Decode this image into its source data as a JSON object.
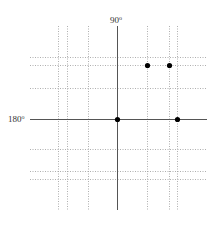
{
  "diagram": {
    "type": "coordinate-grid-with-points",
    "labels": {
      "top_axis": "90",
      "top_axis_unit": "o",
      "left_axis": "180",
      "left_axis_unit": "o"
    },
    "axes": {
      "vertical_x": 117,
      "horizontal_y": 119,
      "vertical_range": [
        26,
        210
      ],
      "horizontal_range": [
        30,
        207
      ],
      "color": "#555555"
    },
    "dotted_verticals": [
      58,
      67,
      88,
      147,
      169,
      177
    ],
    "dotted_horizontals": [
      57,
      65,
      88,
      149,
      171,
      179
    ],
    "dotted_vertical_range": [
      26,
      210
    ],
    "dotted_horizontal_range": [
      30,
      207
    ],
    "dotted_color": "#9a9a9a",
    "points": [
      {
        "x": 147,
        "y": 65
      },
      {
        "x": 169,
        "y": 65
      },
      {
        "x": 117,
        "y": 119
      },
      {
        "x": 177,
        "y": 119
      }
    ],
    "point_color": "#000000",
    "point_radius": 2.6
  }
}
